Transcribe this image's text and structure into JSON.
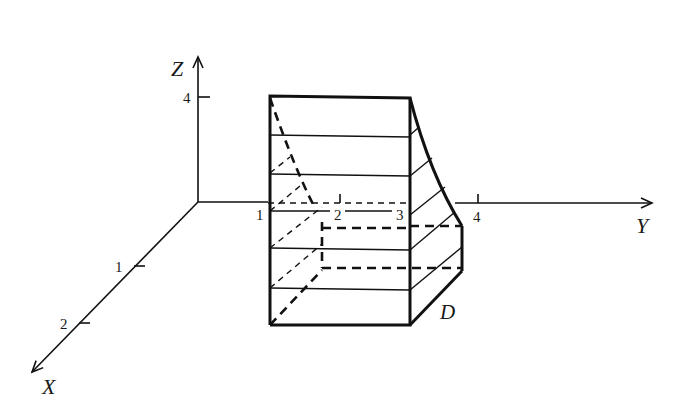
{
  "axes": {
    "z": {
      "label": "Z",
      "ticks": [
        {
          "label": "4"
        }
      ]
    },
    "y": {
      "label": "Y",
      "ticks": [
        {
          "label": "1"
        },
        {
          "label": "2"
        },
        {
          "label": "3"
        },
        {
          "label": "4"
        }
      ]
    },
    "x": {
      "label": "X",
      "ticks": [
        {
          "label": "1"
        },
        {
          "label": "2"
        }
      ]
    }
  },
  "region": {
    "label": "D"
  },
  "colors": {
    "stroke": "#111111",
    "background": "#ffffff"
  }
}
